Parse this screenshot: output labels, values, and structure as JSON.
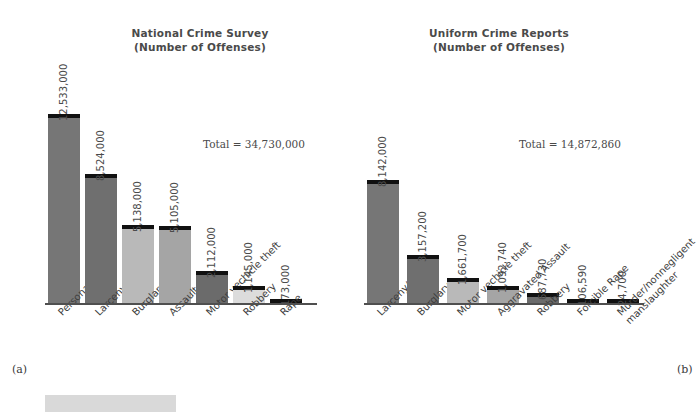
{
  "figure": {
    "panel_a_letter": "(a)",
    "panel_b_letter": "(b)"
  },
  "chart_data": [
    {
      "type": "bar",
      "panel": "a",
      "title": "National Crime Survey\n(Number of Offenses)",
      "total_label": "Total = 34,730,000",
      "total_value": 34730000,
      "xlabel": "",
      "ylabel": "Number of Offenses",
      "ylim": [
        0,
        13500000
      ],
      "grid": false,
      "legend": "none",
      "categories": [
        "Personal theft",
        "Larceny",
        "Burglary",
        "Assault",
        "Motor vechicle theft",
        "Robbery",
        "Rape"
      ],
      "values": [
        12533000,
        8524000,
        5138000,
        5105000,
        2112000,
        1145000,
        173000
      ],
      "value_labels": [
        "12,533,000",
        "8,524,000",
        "5,138,000",
        "5,105,000",
        "2,112,000",
        "1,145,000",
        "173,000"
      ],
      "bar_colors": [
        "#767676",
        "#6f6f6f",
        "#b9b9b9",
        "#a5a5a5",
        "#6b6b6b",
        "#dcdcdc",
        "#111111"
      ],
      "bar_cap_color": "#111111"
    },
    {
      "type": "bar",
      "panel": "b",
      "title": "Uniform Crime Reports\n(Number of Offenses)",
      "total_label": "Total = 14,872,860",
      "total_value": 14872860,
      "xlabel": "",
      "ylabel": "Number of Offenses",
      "ylim": [
        0,
        13500000
      ],
      "grid": false,
      "legend": "none",
      "categories": [
        "Larceny/theft",
        "Burglary",
        "Motor vechicle theft",
        "Aggravated Assault",
        "Robbery",
        "Forcible Rape",
        "Murder/nonnegligent\nmanslaughter"
      ],
      "values": [
        8142000,
        3157200,
        1661700,
        1092740,
        687730,
        106590,
        24700
      ],
      "value_labels": [
        "8,142,000",
        "3,157,200",
        "1,661,700",
        "1,092,740",
        "687,730",
        "106,590",
        "24,700"
      ],
      "bar_colors": [
        "#767676",
        "#6f6f6f",
        "#b9b9b9",
        "#a5a5a5",
        "#6b6b6b",
        "#c9c9c9",
        "#9a9a9a"
      ],
      "bar_cap_color": "#111111"
    }
  ]
}
